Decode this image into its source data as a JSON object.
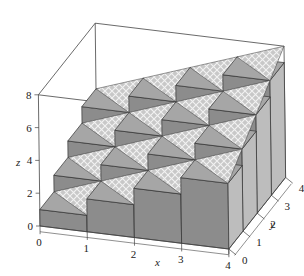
{
  "chart_data": {
    "type": "bar3d",
    "title": "",
    "xlabel": "x",
    "ylabel": "y",
    "zlabel": "z",
    "xlim": [
      0,
      4
    ],
    "ylim": [
      0,
      4
    ],
    "zlim": [
      0,
      8
    ],
    "x_ticks": [
      "0",
      "1",
      "2",
      "3",
      "4"
    ],
    "y_ticks": [
      "0",
      "1",
      "2",
      "3",
      "4"
    ],
    "z_ticks": [
      "0",
      "2",
      "4",
      "6",
      "8"
    ],
    "x_edges": [
      0,
      1,
      2,
      3,
      4
    ],
    "y_edges": [
      0,
      1,
      2,
      3,
      4
    ],
    "surface": "z = x + y",
    "bar_heights": [
      [
        1,
        2,
        3,
        4
      ],
      [
        2,
        3,
        4,
        5
      ],
      [
        3,
        4,
        5,
        6
      ],
      [
        4,
        5,
        6,
        7
      ]
    ],
    "bar_heights_note": "rows indexed by y-cell (0..3), columns by x-cell (0..3)",
    "colors": {
      "bar_front": "#8c8c8c",
      "bar_side": "#bdbdbd",
      "bar_top": "#a6a6a6",
      "surface_fill": "#d4d4d4",
      "surface_hatch": "#ffffff",
      "edge": "#333333",
      "box": "#444444"
    }
  }
}
